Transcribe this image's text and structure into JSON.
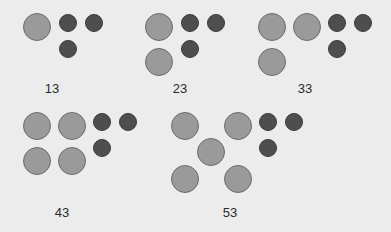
{
  "colors": {
    "background": "#ececec",
    "tens_circle": "#9a9a9a",
    "ones_circle": "#4e4e4e",
    "label": "#2a2a2a"
  },
  "groups": [
    {
      "label": "13",
      "label_pos": [
        52,
        88
      ],
      "tens": [
        [
          37,
          27
        ]
      ],
      "ones": [
        [
          68,
          23
        ],
        [
          94,
          23
        ],
        [
          68,
          49
        ]
      ]
    },
    {
      "label": "23",
      "label_pos": [
        180,
        88
      ],
      "tens": [
        [
          159,
          27
        ],
        [
          159,
          62
        ]
      ],
      "ones": [
        [
          190,
          23
        ],
        [
          216,
          23
        ],
        [
          190,
          49
        ]
      ]
    },
    {
      "label": "33",
      "label_pos": [
        305,
        88
      ],
      "tens": [
        [
          272,
          27
        ],
        [
          307,
          27
        ],
        [
          272,
          62
        ]
      ],
      "ones": [
        [
          337,
          23
        ],
        [
          363,
          23
        ],
        [
          337,
          49
        ]
      ]
    },
    {
      "label": "43",
      "label_pos": [
        62,
        212
      ],
      "tens": [
        [
          37,
          126
        ],
        [
          72,
          126
        ],
        [
          37,
          161
        ],
        [
          72,
          161
        ]
      ],
      "ones": [
        [
          102,
          122
        ],
        [
          128,
          122
        ],
        [
          102,
          148
        ]
      ]
    },
    {
      "label": "53",
      "label_pos": [
        230,
        212
      ],
      "tens": [
        [
          185,
          126
        ],
        [
          238,
          126
        ],
        [
          211,
          152
        ],
        [
          185,
          179
        ],
        [
          238,
          179
        ]
      ],
      "ones": [
        [
          268,
          122
        ],
        [
          294,
          122
        ],
        [
          268,
          148
        ]
      ]
    }
  ]
}
